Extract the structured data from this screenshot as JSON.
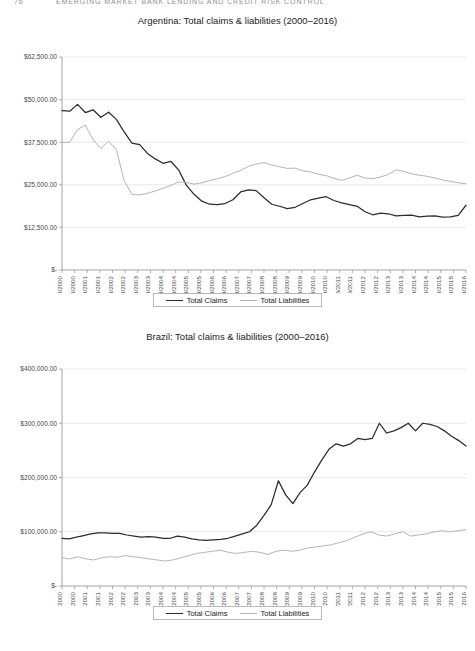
{
  "page_header": {
    "folio": "76",
    "running_title": "EMERGING MARKET BANK LENDING AND CREDIT RISK CONTROL"
  },
  "legend": {
    "claims_label": "Total Claims",
    "liabilities_label": "Total Liabilities",
    "claims_color": "#2b2b2b",
    "liabilities_color": "#b5b5b5"
  },
  "chart_data": [
    {
      "type": "line",
      "title": "Argentina: Total claims & liabilities (2000–2016)",
      "xlabel": "",
      "ylabel": "",
      "ylim": [
        0,
        62500
      ],
      "yticks": [
        0,
        12500,
        25000,
        37500,
        50000,
        62500
      ],
      "ytick_labels": [
        "$-",
        "$12,500.00",
        "$25,000.00",
        "$37,500.00",
        "$50,000.00",
        "$62,500.00"
      ],
      "grid": true,
      "legend_position": "bottom",
      "x": [
        "31/03/2000",
        "30/09/2000",
        "31/03/2001",
        "30/09/2001",
        "31/03/2002",
        "30/09/2002",
        "31/03/2003",
        "30/09/2003",
        "31/03/2004",
        "30/09/2004",
        "31/03/2005",
        "30/09/2005",
        "31/03/2006",
        "30/09/2006",
        "31/03/2007",
        "30/09/2007",
        "31/03/2008",
        "30/09/2008",
        "31/03/2009",
        "30/09/2009",
        "31/03/2010",
        "30/09/2010",
        "31/03/2011",
        "30/09/2011",
        "31/03/2012",
        "30/09/2012",
        "31/03/2013",
        "30/09/2013",
        "31/03/2014",
        "30/09/2014",
        "31/03/2015",
        "30/09/2015",
        "31/03/2016"
      ],
      "series": [
        {
          "name": "Total Claims",
          "color": "#2b2b2b",
          "values": [
            46800,
            46600,
            48600,
            46200,
            47000,
            44800,
            46300,
            44200,
            40500,
            37200,
            36800,
            34200,
            32600,
            31300,
            31900,
            29400,
            24900,
            22200,
            20200,
            19300,
            19200,
            19500,
            20600,
            22900,
            23500,
            23300,
            21200,
            19300,
            18700,
            18000,
            18400,
            19500,
            20600,
            21100,
            21500,
            20400,
            19700,
            19200,
            18700,
            17100,
            16200,
            16700,
            16500,
            15900,
            16000,
            16100,
            15600,
            15800,
            15900,
            15500,
            15600,
            16000,
            19000
          ]
        },
        {
          "name": "Total Liabilities",
          "color": "#b5b5b5",
          "values": [
            37400,
            37500,
            41200,
            42500,
            38200,
            35700,
            37800,
            35300,
            26200,
            22200,
            22000,
            22500,
            23200,
            24000,
            24800,
            25800,
            25700,
            25200,
            25600,
            26200,
            26800,
            27400,
            28400,
            29200,
            30400,
            31100,
            31500,
            30800,
            30300,
            29800,
            29900,
            29100,
            28800,
            28100,
            27700,
            26900,
            26300,
            27000,
            27800,
            27000,
            26800,
            27300,
            28000,
            29400,
            28900,
            28200,
            27800,
            27500,
            27000,
            26400,
            26000,
            25600,
            25300
          ]
        }
      ]
    },
    {
      "type": "line",
      "title": "Brazil: Total claims & liabilities (2000–2016)",
      "xlabel": "",
      "ylabel": "",
      "ylim": [
        0,
        400000
      ],
      "yticks": [
        0,
        100000,
        200000,
        300000,
        400000
      ],
      "ytick_labels": [
        "$-",
        "$100,000.00",
        "$200,000.00",
        "$300,000.00",
        "$400,000.00"
      ],
      "grid": true,
      "legend_position": "bottom",
      "x": [
        "31/03/2000",
        "30/09/2000",
        "31/03/2001",
        "30/09/2001",
        "31/03/2002",
        "30/09/2002",
        "31/03/2003",
        "30/09/2003",
        "31/03/2004",
        "30/09/2004",
        "31/03/2005",
        "30/09/2005",
        "31/03/2006",
        "30/09/2006",
        "31/03/2007",
        "30/09/2007",
        "31/03/2008",
        "30/09/2008",
        "31/03/2009",
        "30/09/2009",
        "31/03/2010",
        "30/09/2010",
        "31/03/2011",
        "30/09/2011",
        "31/03/2012",
        "30/09/2012",
        "31/03/2013",
        "30/09/2013",
        "31/03/2014",
        "30/09/2014",
        "31/03/2015",
        "30/09/2015",
        "31/03/2016"
      ],
      "series": [
        {
          "name": "Total Claims",
          "color": "#2b2b2b",
          "values": [
            88000,
            87000,
            90000,
            93000,
            96000,
            98000,
            98000,
            97000,
            97000,
            94000,
            92000,
            90000,
            91000,
            90000,
            88000,
            88000,
            92000,
            90000,
            87000,
            85000,
            84000,
            85000,
            86000,
            88000,
            92000,
            96000,
            100000,
            112000,
            130000,
            150000,
            194000,
            168000,
            152000,
            172000,
            186000,
            210000,
            232000,
            252000,
            262000,
            258000,
            262000,
            272000,
            270000,
            272000,
            300000,
            282000,
            286000,
            292000,
            300000,
            286000,
            300000,
            298000,
            294000,
            286000,
            276000,
            268000,
            258000
          ]
        },
        {
          "name": "Total Liabilities",
          "color": "#b5b5b5",
          "values": [
            52000,
            50000,
            54000,
            50000,
            48000,
            52000,
            54000,
            53000,
            56000,
            54000,
            52000,
            50000,
            48000,
            46000,
            48000,
            52000,
            56000,
            60000,
            62000,
            64000,
            66000,
            62000,
            60000,
            62000,
            64000,
            62000,
            58000,
            64000,
            66000,
            64000,
            66000,
            70000,
            72000,
            74000,
            76000,
            80000,
            84000,
            90000,
            96000,
            100000,
            94000,
            92000,
            96000,
            100000,
            92000,
            94000,
            96000,
            100000,
            102000,
            100000,
            102000,
            104000
          ]
        }
      ]
    }
  ]
}
